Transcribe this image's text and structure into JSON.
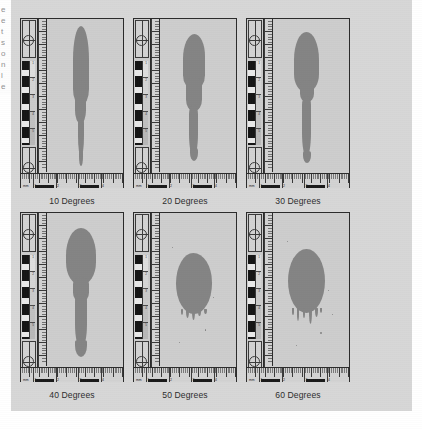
{
  "figure": {
    "background_color": "#d7d7d7",
    "page_color": "#ffffff",
    "stain_color": "#848484",
    "card_color": "#cfcfcf",
    "ink_color": "#2b2b2b",
    "edge_fragment_glyphs": [
      "e",
      "e",
      "t",
      "s",
      "o",
      "n",
      "l",
      "e"
    ]
  },
  "chart_data": {
    "type": "table",
    "xlabel": "Angle of impact",
    "ylabel": "Stain morphology",
    "categories": [
      "10 Degrees",
      "20 Degrees",
      "30 Degrees",
      "40 Degrees",
      "50 Degrees",
      "60 Degrees"
    ],
    "series": [
      {
        "name": "Elongation (length/width ratio)",
        "values": [
          5.8,
          3.6,
          2.6,
          2.0,
          1.15,
          1.1
        ]
      },
      {
        "name": "Tail present",
        "values": [
          1,
          1,
          1,
          1,
          0,
          0
        ]
      },
      {
        "name": "Spines / drip count",
        "values": [
          0,
          0,
          0,
          0,
          5,
          6
        ]
      }
    ]
  },
  "panels": [
    {
      "id": "panel-10",
      "caption": "10 Degrees",
      "angle_degrees": 10,
      "stain": {
        "shape": "highly-elongated-teardrop",
        "elongation": 5.8,
        "tail": true,
        "spines": 0
      },
      "ruler": {
        "unit_label": "mm",
        "tick_numbers": [
          "1",
          "2",
          "3",
          "4"
        ]
      }
    },
    {
      "id": "panel-20",
      "caption": "20 Degrees",
      "angle_degrees": 20,
      "stain": {
        "shape": "elongated-teardrop",
        "elongation": 3.6,
        "tail": true,
        "spines": 0
      },
      "ruler": {
        "unit_label": "mm",
        "tick_numbers": [
          "1",
          "2",
          "3",
          "4"
        ]
      }
    },
    {
      "id": "panel-30",
      "caption": "30 Degrees",
      "angle_degrees": 30,
      "stain": {
        "shape": "oval-with-tail",
        "elongation": 2.6,
        "tail": true,
        "spines": 0
      },
      "ruler": {
        "unit_label": "mm",
        "tick_numbers": [
          "1",
          "2",
          "3",
          "4"
        ]
      }
    },
    {
      "id": "panel-40",
      "caption": "40 Degrees",
      "angle_degrees": 40,
      "stain": {
        "shape": "round-head-with-thick-tail",
        "elongation": 2.0,
        "tail": true,
        "spines": 0
      },
      "ruler": {
        "unit_label": "mm",
        "tick_numbers": [
          "1",
          "2",
          "3",
          "4"
        ]
      }
    },
    {
      "id": "panel-50",
      "caption": "50 Degrees",
      "angle_degrees": 50,
      "stain": {
        "shape": "near-circular-with-spines",
        "elongation": 1.15,
        "tail": false,
        "spines": 5
      },
      "ruler": {
        "unit_label": "mm",
        "tick_numbers": [
          "1",
          "2",
          "3",
          "4"
        ]
      }
    },
    {
      "id": "panel-60",
      "caption": "60 Degrees",
      "angle_degrees": 60,
      "stain": {
        "shape": "circular-with-drips",
        "elongation": 1.1,
        "tail": false,
        "spines": 6
      },
      "ruler": {
        "unit_label": "mm",
        "tick_numbers": [
          "1",
          "2",
          "3",
          "4"
        ]
      }
    }
  ]
}
